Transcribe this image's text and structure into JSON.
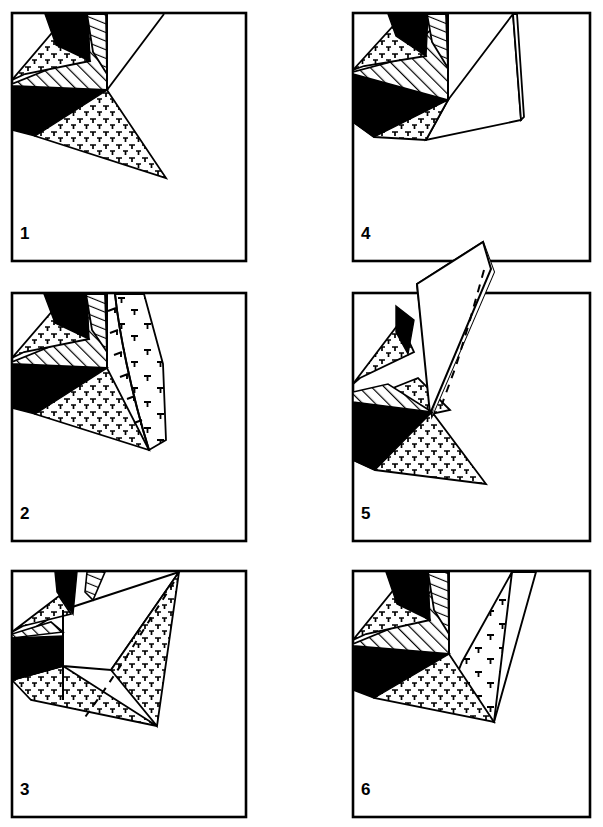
{
  "figure": {
    "title": "",
    "background_color": "#ffffff",
    "ink_color": "#000000",
    "width": 603,
    "height": 827,
    "panel_count": 6,
    "layout": "2 columns x 3 rows",
    "legend_patterns": {
      "solid_black": "black filled unit",
      "cross_stipple": "plutonic / granite cross-and-tick stipple",
      "diagonal_hatch": "diagonal line hatch unit",
      "vertical_hatch": "steep line hatch unit",
      "white_blank": "unornamented white unit",
      "dashed_line": "inferred / hidden contact",
      "tick_arc": "curved contact with ticks"
    }
  },
  "panels": [
    {
      "id": "panel-1",
      "number": "1",
      "column": 0,
      "row": 0,
      "frame": {
        "x": 11,
        "y": 12,
        "w": 236,
        "h": 250
      },
      "number_pos": {
        "x": 20,
        "y": 237
      }
    },
    {
      "id": "panel-4",
      "number": "4",
      "column": 1,
      "row": 0,
      "frame": {
        "x": 352,
        "y": 12,
        "w": 239,
        "h": 250
      },
      "number_pos": {
        "x": 361,
        "y": 237
      }
    },
    {
      "id": "panel-2",
      "number": "2",
      "column": 0,
      "row": 1,
      "frame": {
        "x": 11,
        "y": 292,
        "w": 236,
        "h": 250
      },
      "number_pos": {
        "x": 20,
        "y": 517
      }
    },
    {
      "id": "panel-5",
      "number": "5",
      "column": 1,
      "row": 1,
      "frame": {
        "x": 352,
        "y": 292,
        "w": 239,
        "h": 250
      },
      "number_pos": {
        "x": 361,
        "y": 517
      }
    },
    {
      "id": "panel-3",
      "number": "3",
      "column": 0,
      "row": 2,
      "frame": {
        "x": 11,
        "y": 570,
        "w": 236,
        "h": 248
      },
      "number_pos": {
        "x": 20,
        "y": 793
      }
    },
    {
      "id": "panel-6",
      "number": "6",
      "column": 1,
      "row": 2,
      "frame": {
        "x": 352,
        "y": 570,
        "w": 239,
        "h": 248
      },
      "number_pos": {
        "x": 361,
        "y": 793
      }
    }
  ],
  "numbers": {
    "p1": "1",
    "p2": "2",
    "p3": "3",
    "p4": "4",
    "p5": "5",
    "p6": "6"
  }
}
